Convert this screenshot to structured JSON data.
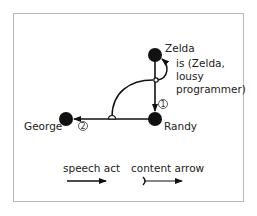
{
  "nodes": {
    "zelda": "Zelda",
    "randy": "Randy",
    "george": "George"
  },
  "content_label": [
    "is (Zelda,",
    "lousy",
    "programmer)"
  ],
  "step_numbers": {
    "first": "1",
    "second": "2"
  },
  "legend": {
    "speech_act": "speech act",
    "content_arrow": "content arrow"
  },
  "colors": {
    "ink": "#111111",
    "frame": "#b8b8b8"
  }
}
